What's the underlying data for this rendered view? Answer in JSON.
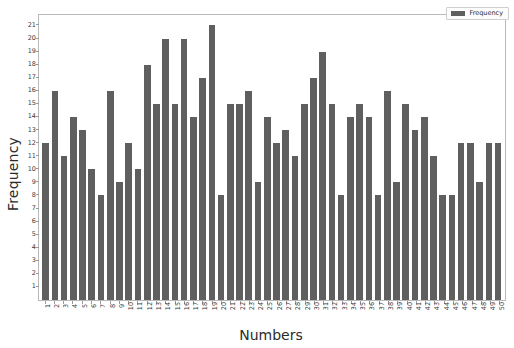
{
  "chart_data": {
    "type": "bar",
    "title": "",
    "xlabel": "Numbers",
    "ylabel": "Frequency",
    "legend": [
      "Frequency"
    ],
    "legend_position": "top-right",
    "grid": false,
    "bar_color": "#5f5f5f",
    "ylim": [
      0,
      21.8
    ],
    "yticks": [
      1,
      2,
      3,
      4,
      5,
      6,
      7,
      8,
      9,
      10,
      11,
      12,
      13,
      14,
      15,
      16,
      17,
      18,
      19,
      20,
      21
    ],
    "categories": [
      "1",
      "2",
      "3",
      "4",
      "5",
      "6",
      "7",
      "8",
      "9",
      "10",
      "11",
      "12",
      "13",
      "14",
      "15",
      "16",
      "17",
      "18",
      "19",
      "20",
      "21",
      "22",
      "23",
      "24",
      "25",
      "26",
      "27",
      "28",
      "29",
      "30",
      "31",
      "32",
      "33",
      "34",
      "35",
      "36",
      "37",
      "38",
      "39",
      "40",
      "41",
      "42",
      "43",
      "44",
      "45",
      "46",
      "47",
      "48",
      "49",
      "50"
    ],
    "values": [
      12,
      16,
      11,
      14,
      13,
      10,
      8,
      16,
      9,
      12,
      10,
      18,
      15,
      20,
      15,
      20,
      14,
      17,
      21,
      8,
      15,
      15,
      16,
      9,
      14,
      12,
      13,
      11,
      15,
      17,
      19,
      15,
      8,
      14,
      15,
      14,
      8,
      16,
      9,
      15,
      13,
      14,
      11,
      8,
      8,
      12,
      12,
      9,
      12,
      12
    ],
    "series": [
      {
        "name": "Frequency",
        "values": [
          12,
          16,
          11,
          14,
          13,
          10,
          8,
          16,
          9,
          12,
          10,
          18,
          15,
          20,
          15,
          20,
          14,
          17,
          21,
          8,
          15,
          15,
          16,
          9,
          14,
          12,
          13,
          11,
          15,
          17,
          19,
          15,
          8,
          14,
          15,
          14,
          8,
          16,
          9,
          15,
          13,
          14,
          11,
          8,
          8,
          12,
          12,
          9,
          12,
          12
        ]
      }
    ]
  }
}
